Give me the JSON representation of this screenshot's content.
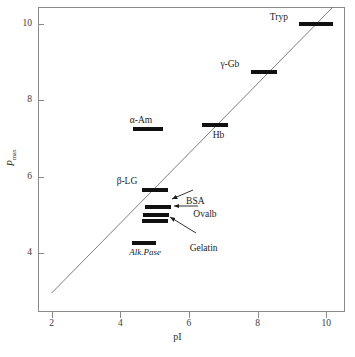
{
  "chart_data": {
    "type": "scatter",
    "title": "",
    "xlabel": "pI",
    "ylabel": "P max",
    "ylabel_base": "P",
    "ylabel_sub": "max",
    "xlim": [
      1.6,
      10.55
    ],
    "ylim": [
      2.45,
      10.45
    ],
    "xticks": [
      2,
      4,
      6,
      8,
      10
    ],
    "yticks": [
      4,
      6,
      8,
      10
    ],
    "xtick_labels": [
      "2",
      "4",
      "6",
      "8",
      "10"
    ],
    "ytick_labels": [
      "4",
      "6",
      "8",
      "10"
    ],
    "grid": false,
    "legend": "none",
    "marker_style": "horizontal-bar",
    "reference_line": {
      "label": "identity trend line",
      "x_start": 2.0,
      "y_start": 2.95,
      "x_end": 10.2,
      "y_end": 10.45
    },
    "points": [
      {
        "name": "Tryp",
        "label": "Tryp",
        "pI": 9.7,
        "Pmax": 10.0,
        "label_pos": "left",
        "italic": false
      },
      {
        "name": "gamma-Gb",
        "label": "γ-Gb",
        "pI": 8.2,
        "Pmax": 8.75,
        "label_pos": "left",
        "italic": false
      },
      {
        "name": "Hb",
        "label": "Hb",
        "pI": 6.75,
        "Pmax": 7.35,
        "label_pos": "below",
        "italic": false
      },
      {
        "name": "alpha-Am",
        "label": "α-Am",
        "pI": 4.8,
        "Pmax": 7.25,
        "label_pos": "above",
        "italic": false
      },
      {
        "name": "beta-LG",
        "label": "β-LG",
        "pI": 5.0,
        "Pmax": 5.65,
        "label_pos": "above-left",
        "italic": false
      },
      {
        "name": "BSA",
        "label": "BSA",
        "pI": 5.1,
        "Pmax": 5.2,
        "label_pos": "arrow-right",
        "italic": false
      },
      {
        "name": "Ovalb",
        "label": "Ovalb",
        "pI": 5.05,
        "Pmax": 5.0,
        "label_pos": "arrow-right",
        "italic": false
      },
      {
        "name": "Gelatin",
        "label": "Gelatin",
        "pI": 5.0,
        "Pmax": 4.85,
        "label_pos": "arrow-right",
        "italic": false
      },
      {
        "name": "Alk.Pase",
        "label": "Alk.Pase",
        "pI": 4.7,
        "Pmax": 4.25,
        "label_pos": "below",
        "italic": true
      }
    ],
    "colors": {
      "marker": "#111111",
      "axis": "#8a8a8a",
      "text": "#1c1c1c",
      "refline": "#6f6f6f",
      "background": "#ffffff"
    }
  }
}
